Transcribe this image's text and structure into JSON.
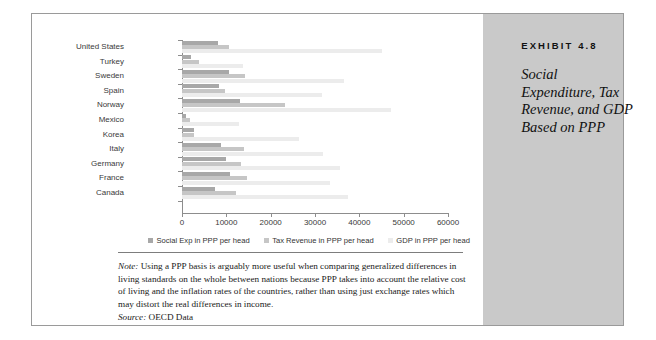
{
  "exhibit": {
    "number_label": "EXHIBIT 4.8",
    "title": "Social Expenditure, Tax Revenue, and GDP Based on PPP"
  },
  "note": {
    "prefix": "Note:",
    "text": " Using a PPP basis is arguably more useful when comparing generalized differences in living standards on the whole between nations because PPP takes into account the relative cost of living and the inflation rates of the countries, rather than using just exchange rates which may distort the real differences in income."
  },
  "source": {
    "prefix": "Source:",
    "text": " OECD Data"
  },
  "chart_data": {
    "type": "bar",
    "orientation": "horizontal",
    "title": "",
    "xlabel": "",
    "ylabel": "",
    "xlim": [
      0,
      60000
    ],
    "xticks": [
      0,
      10000,
      20000,
      30000,
      40000,
      50000,
      60000
    ],
    "xtick_labels": [
      "0",
      "10000",
      "20000",
      "30000",
      "40000",
      "50000",
      "60000"
    ],
    "grid": false,
    "legend_position": "bottom",
    "categories": [
      "United States",
      "Turkey",
      "Sweden",
      "Spain",
      "Norway",
      "Mexico",
      "Korea",
      "Italy",
      "Germany",
      "France",
      "Canada"
    ],
    "series": [
      {
        "name": "Social Exp in PPP per head",
        "color": "#a8a8a8",
        "values": [
          8200,
          2000,
          10600,
          8400,
          13000,
          900,
          2600,
          8900,
          10000,
          10900,
          7400
        ]
      },
      {
        "name": "Tax Revenue in PPP per head",
        "color": "#c6c6c6",
        "values": [
          10600,
          3800,
          14200,
          9800,
          23200,
          1800,
          2800,
          13900,
          13300,
          14700,
          12200
        ]
      },
      {
        "name": "GDP in PPP per head",
        "color": "#ececec",
        "values": [
          45000,
          13800,
          36600,
          31600,
          47200,
          12900,
          26400,
          31800,
          35600,
          33400,
          37400
        ]
      }
    ]
  }
}
